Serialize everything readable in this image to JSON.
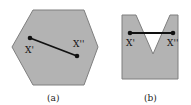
{
  "figures": [
    {
      "id": "a",
      "caption": "(a)",
      "shape": "convex hexagon",
      "point1_label": "X'",
      "point2_label": "X''"
    },
    {
      "id": "b",
      "caption": "(b)",
      "shape": "non-convex V-notch",
      "point1_label": "X'",
      "point2_label": "X''"
    }
  ],
  "colors": {
    "fill": "#b3b3b3",
    "stroke": "#7a7a7a",
    "line": "#111111"
  }
}
